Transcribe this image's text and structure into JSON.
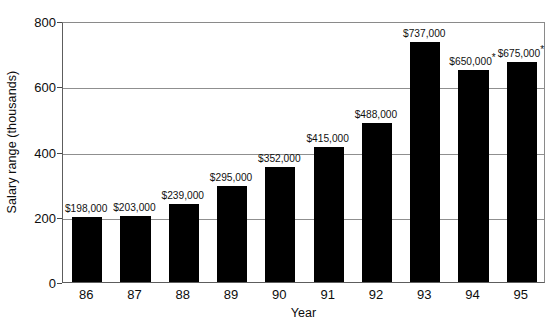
{
  "chart_data": {
    "type": "bar",
    "title": "",
    "subtitle": "",
    "xlabel": "Year",
    "ylabel": "Salary range (thousands)",
    "categories": [
      "86",
      "87",
      "88",
      "89",
      "90",
      "91",
      "92",
      "93",
      "94",
      "95"
    ],
    "values": [
      198,
      203,
      239,
      295,
      352,
      415,
      488,
      737,
      650,
      675
    ],
    "data_labels": [
      "$198,000",
      "$203,000",
      "$239,000",
      "$295,000",
      "$352,000",
      "$415,000",
      "$488,000",
      "$737,000",
      "$650,000",
      "$675,000"
    ],
    "data_label_markers": [
      "",
      "",
      "",
      "",
      "",
      "",
      "",
      "",
      "*",
      "*"
    ],
    "ylim": [
      0,
      800
    ],
    "y_ticks": [
      0,
      200,
      400,
      600,
      800
    ],
    "y_tick_labels": [
      "0",
      "200",
      "400",
      "600",
      "800"
    ],
    "grid": true,
    "grid_axis": "y",
    "legend": false,
    "legend_position": "none",
    "bar_color": "#000000",
    "grid_color": "#8f8f8f",
    "axis_color": "#5d5d5d",
    "background_color": "#ffffff",
    "series": [
      {
        "name": "Salary range",
        "values": [
          198,
          203,
          239,
          295,
          352,
          415,
          488,
          737,
          650,
          675
        ]
      }
    ]
  }
}
